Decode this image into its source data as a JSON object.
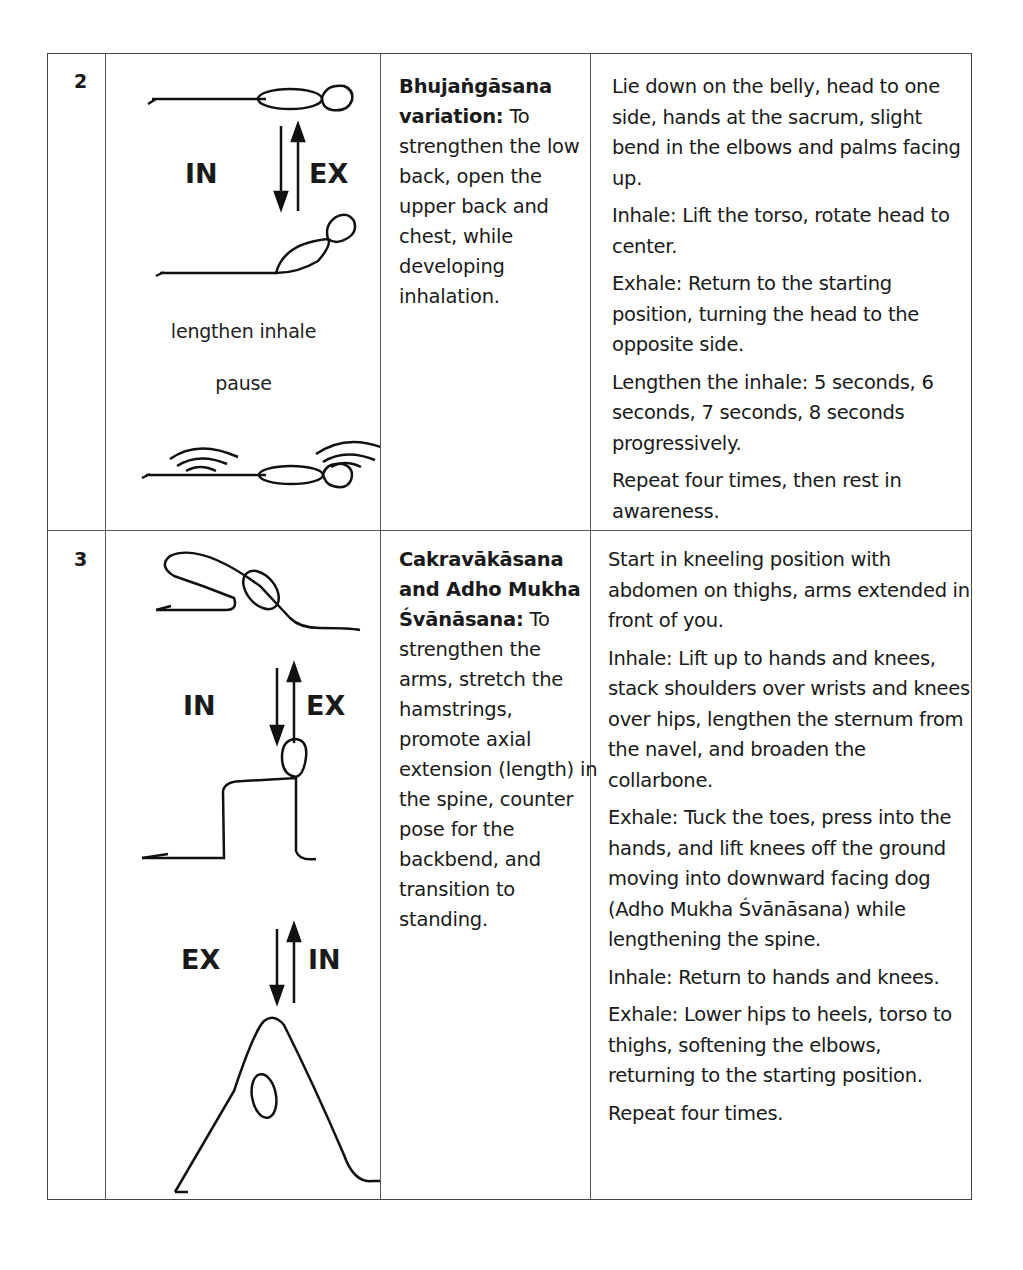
{
  "rows": [
    {
      "number": "2",
      "figure": {
        "arrow1": {
          "left": "IN",
          "right": "EX"
        },
        "caption1": "lengthen inhale",
        "caption2": "pause"
      },
      "pose_name": "Bhujaṅgāsana variation:",
      "purpose": " To strengthen the low back, open the upper back and chest, while developing inhalation.",
      "instructions": [
        "Lie down on the belly, head to one side, hands at the sacrum, slight bend in the elbows and palms facing up.",
        "Inhale: Lift the torso, rotate head to center.",
        "Exhale: Return to the starting position, turning the head to the opposite side.",
        "Lengthen the inhale: 5 seconds, 6 seconds, 7 seconds, 8 seconds progressively.",
        "Repeat four times, then rest in awareness."
      ]
    },
    {
      "number": "3",
      "figure": {
        "arrow1": {
          "left": "IN",
          "right": "EX"
        },
        "arrow2": {
          "left": "EX",
          "right": "IN"
        }
      },
      "pose_name": "Cakravākāsana and Adho Mukha Śvānāsana:",
      "purpose": " To strengthen the arms, stretch the hamstrings, promote axial extension (length) in the spine, counter pose for the backbend, and transition to standing.",
      "instructions": [
        "Start in kneeling position with abdomen on thighs, arms extended in front of you.",
        "Inhale: Lift up to hands and knees, stack shoulders over wrists and knees over hips, lengthen the sternum from the navel, and broaden the collarbone.",
        "Exhale: Tuck the toes, press into the hands, and lift knees off the ground moving into downward facing dog (Adho Mukha Śvānāsana) while lengthening the spine.",
        "Inhale: Return to hands and knees.",
        "Exhale: Lower hips to heels, torso to thighs, softening the elbows, returning to the starting position.",
        "Repeat four times."
      ]
    }
  ]
}
